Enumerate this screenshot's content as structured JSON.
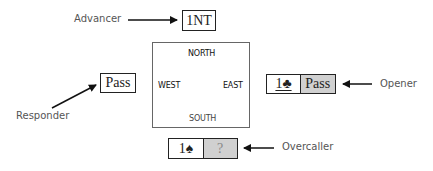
{
  "diagram": {
    "compass": {
      "north": "NORTH",
      "south": "SOUTH",
      "west": "WEST",
      "east": "EAST"
    },
    "roles": {
      "advancer": {
        "label": "Advancer",
        "bids": [
          "1NT"
        ]
      },
      "responder": {
        "label": "Responder",
        "bids": [
          "Pass"
        ]
      },
      "opener": {
        "label": "Opener",
        "bids": [
          "1♣",
          "Pass"
        ]
      },
      "overcaller": {
        "label": "Overcaller",
        "bids": [
          "1♠",
          "?"
        ]
      }
    },
    "colors": {
      "box_border": "#222222",
      "gray_cell": "#d0d0d0",
      "label_text": "#555555",
      "arrow": "#111111"
    }
  }
}
